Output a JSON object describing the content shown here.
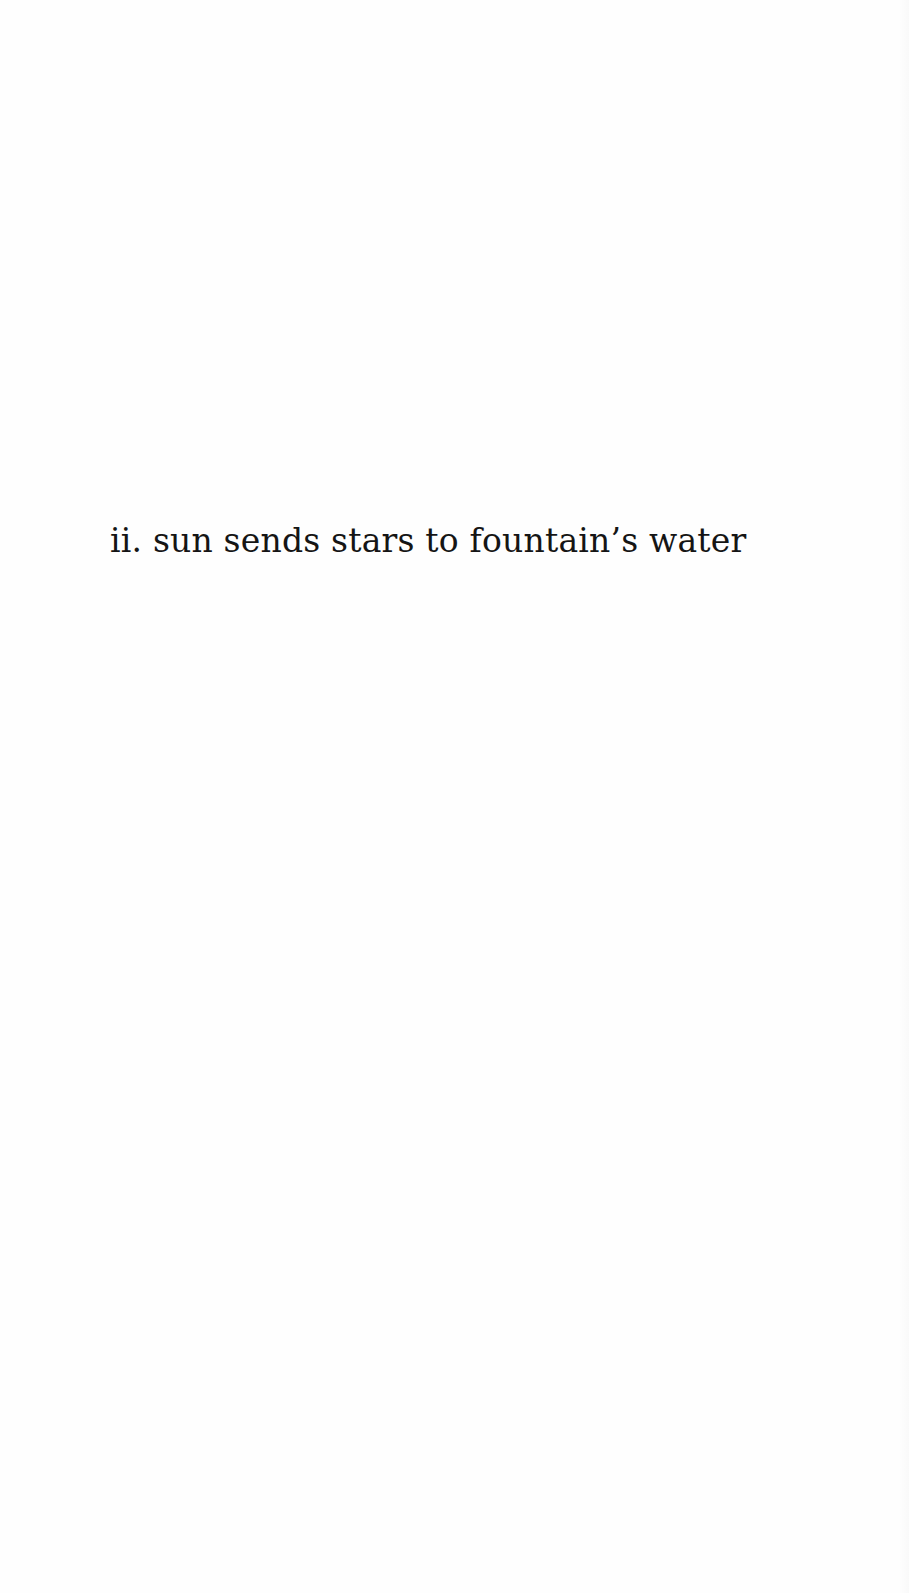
{
  "page": {
    "section_title": "ii. sun sends stars to fountain’s water",
    "text_color": "#151515",
    "background_color": "#fefefe"
  }
}
